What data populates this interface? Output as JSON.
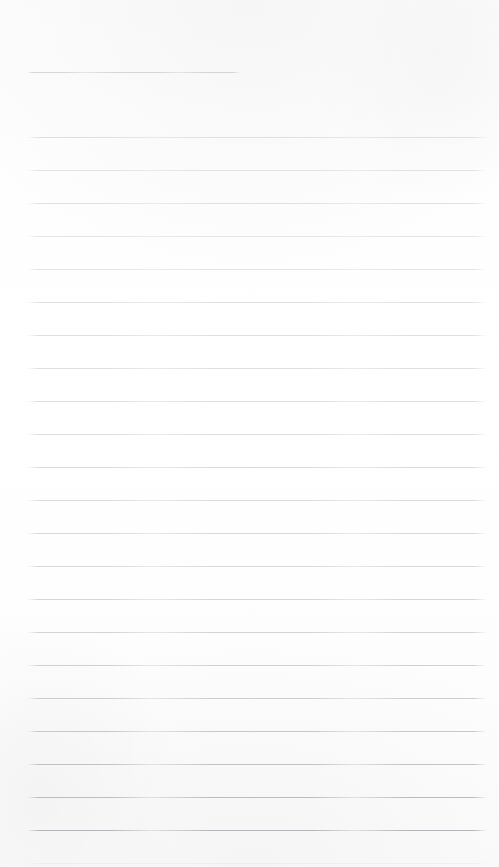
{
  "document": {
    "type": "blank-ruled-notebook-paper",
    "title": "Blank Ruled Notebook Paper",
    "surface_label": "lined paper sheet",
    "page_text": "",
    "handwriting": "",
    "is_blank": true,
    "width_px": 499,
    "height_px": 867
  },
  "paper": {
    "background_color": "#fdfdfd",
    "tint_color": "#fbfbfc",
    "edge_shadow_color": "#f4f4f5",
    "texture": "subtle scan mottling"
  },
  "ruling": {
    "style": "wide-ruled horizontal lines",
    "line_color": "#c9cbd0",
    "line_color_faint": "#dcdee2",
    "line_color_strong": "#b4b7be",
    "line_count": 24,
    "left_margin_px": 27,
    "right_edge_px": 487,
    "line_spacing_px": 33,
    "first_line_y_px": 72,
    "header_rule_is_short": true,
    "header_rule_end_px": 240,
    "margin_rule_visible": false,
    "lines": [
      {
        "index": 1,
        "y": 72,
        "x1": 27,
        "x2": 240,
        "opacity": 0.72,
        "color": "#c6c8cd"
      },
      {
        "index": 2,
        "y": 137,
        "x1": 27,
        "x2": 487,
        "opacity": 0.62,
        "color": "#cdcfd4"
      },
      {
        "index": 3,
        "y": 170,
        "x1": 27,
        "x2": 487,
        "opacity": 0.6,
        "color": "#cfd1d6"
      },
      {
        "index": 4,
        "y": 203,
        "x1": 27,
        "x2": 487,
        "opacity": 0.6,
        "color": "#cdcfd4"
      },
      {
        "index": 5,
        "y": 236,
        "x1": 27,
        "x2": 487,
        "opacity": 0.58,
        "color": "#d0d2d7"
      },
      {
        "index": 6,
        "y": 269,
        "x1": 27,
        "x2": 487,
        "opacity": 0.58,
        "color": "#cfd1d6"
      },
      {
        "index": 7,
        "y": 302,
        "x1": 27,
        "x2": 487,
        "opacity": 0.6,
        "color": "#cdcfd4"
      },
      {
        "index": 8,
        "y": 335,
        "x1": 27,
        "x2": 487,
        "opacity": 0.62,
        "color": "#cbcdd2"
      },
      {
        "index": 9,
        "y": 368,
        "x1": 27,
        "x2": 487,
        "opacity": 0.62,
        "color": "#cbcdd2"
      },
      {
        "index": 10,
        "y": 401,
        "x1": 27,
        "x2": 487,
        "opacity": 0.64,
        "color": "#c9cbd0"
      },
      {
        "index": 11,
        "y": 434,
        "x1": 27,
        "x2": 487,
        "opacity": 0.64,
        "color": "#c9cbd0"
      },
      {
        "index": 12,
        "y": 467,
        "x1": 27,
        "x2": 487,
        "opacity": 0.66,
        "color": "#c7c9ce"
      },
      {
        "index": 13,
        "y": 500,
        "x1": 27,
        "x2": 487,
        "opacity": 0.66,
        "color": "#c7c9ce"
      },
      {
        "index": 14,
        "y": 533,
        "x1": 27,
        "x2": 487,
        "opacity": 0.68,
        "color": "#c5c7cc"
      },
      {
        "index": 15,
        "y": 566,
        "x1": 27,
        "x2": 487,
        "opacity": 0.68,
        "color": "#c5c7cc"
      },
      {
        "index": 16,
        "y": 599,
        "x1": 27,
        "x2": 487,
        "opacity": 0.7,
        "color": "#c3c5ca"
      },
      {
        "index": 17,
        "y": 632,
        "x1": 27,
        "x2": 487,
        "opacity": 0.72,
        "color": "#c1c3c8"
      },
      {
        "index": 18,
        "y": 665,
        "x1": 27,
        "x2": 487,
        "opacity": 0.74,
        "color": "#bfc1c6"
      },
      {
        "index": 19,
        "y": 698,
        "x1": 27,
        "x2": 487,
        "opacity": 0.76,
        "color": "#bdbfc4"
      },
      {
        "index": 20,
        "y": 731,
        "x1": 27,
        "x2": 487,
        "opacity": 0.8,
        "color": "#b9bbc0"
      },
      {
        "index": 21,
        "y": 764,
        "x1": 27,
        "x2": 487,
        "opacity": 0.84,
        "color": "#b6b8bd"
      },
      {
        "index": 22,
        "y": 797,
        "x1": 27,
        "x2": 487,
        "opacity": 0.88,
        "color": "#b2b4b9"
      },
      {
        "index": 23,
        "y": 830,
        "x1": 27,
        "x2": 487,
        "opacity": 0.92,
        "color": "#aeb0b5"
      },
      {
        "index": 24,
        "y": 863,
        "x1": 27,
        "x2": 487,
        "opacity": 0.28,
        "color": "#d8dade"
      }
    ]
  }
}
